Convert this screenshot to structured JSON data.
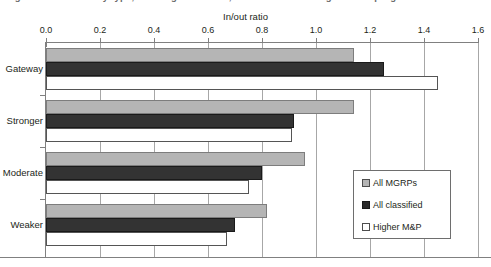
{
  "caption": {
    "clipped_line": "Figure: In/out ratio by type, showing all MGRPs, all classified and higher M&P programs"
  },
  "chart_data": {
    "type": "bar",
    "orientation": "horizontal",
    "title": "",
    "xlabel": "In/out ratio",
    "ylabel": "",
    "xlim": [
      0.0,
      1.6
    ],
    "x_ticks": [
      "0.0",
      "0.2",
      "0.4",
      "0.6",
      "0.8",
      "1.0",
      "1.2",
      "1.4",
      "1.6"
    ],
    "x_tick_values": [
      0.0,
      0.2,
      0.4,
      0.6,
      0.8,
      1.0,
      1.2,
      1.4,
      1.6
    ],
    "categories": [
      "Gateway",
      "Stronger",
      "Moderate",
      "Weaker"
    ],
    "grid": true,
    "legend_position": "inside-right",
    "series": [
      {
        "name": "All MGRPs",
        "color": "#b5b5b5",
        "values": [
          1.14,
          1.14,
          0.96,
          0.82
        ]
      },
      {
        "name": "All classified",
        "color": "#333333",
        "values": [
          1.25,
          0.92,
          0.8,
          0.7
        ]
      },
      {
        "name": "Higher M&P",
        "color": "#ffffff",
        "values": [
          1.45,
          0.91,
          0.75,
          0.67
        ]
      }
    ]
  },
  "axis": {
    "title": "In/out ratio"
  },
  "legend": {
    "items": [
      {
        "label": "All MGRPs"
      },
      {
        "label": "All classified"
      },
      {
        "label": "Higher M&P"
      }
    ]
  },
  "colors": {
    "series1": "#b5b5b5",
    "series2": "#333333",
    "series3": "#ffffff",
    "axis": "#808080",
    "grid": "#a7a7a7",
    "text": "#231f20"
  }
}
